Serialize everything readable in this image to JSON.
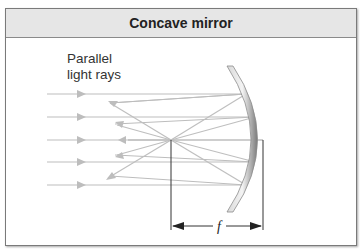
{
  "figure": {
    "title": "Concave mirror",
    "ray_label_line1": "Parallel",
    "ray_label_line2": "light rays",
    "focal_length_label": "f"
  },
  "colors": {
    "header_bg": "#e6e6e6",
    "ray": "#b8b8b8",
    "mirror": "#9a9a9a",
    "dimension": "#222222"
  }
}
